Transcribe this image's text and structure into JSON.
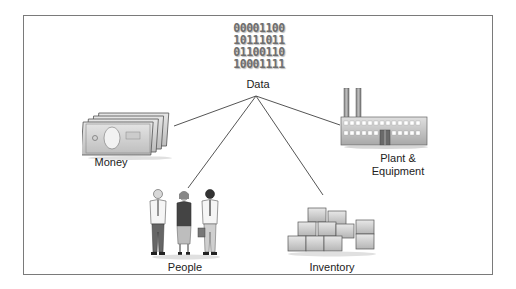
{
  "diagram": {
    "type": "hub-and-spoke",
    "center": {
      "label": "Data",
      "binary_rows": [
        "00001100",
        "10111011",
        "01100110",
        "10001111"
      ]
    },
    "nodes": [
      {
        "id": "money",
        "label": "Money",
        "icon": "money-stack-icon"
      },
      {
        "id": "plant",
        "label_line1": "Plant &",
        "label_line2": "Equipment",
        "icon": "factory-icon"
      },
      {
        "id": "people",
        "label": "People",
        "icon": "people-group-icon"
      },
      {
        "id": "inventory",
        "label": "Inventory",
        "icon": "boxes-icon"
      }
    ],
    "colors": {
      "frame": "#7a7a7a",
      "connector": "#555555",
      "icon_gray": "#c8c8c8",
      "text": "#222222"
    }
  }
}
